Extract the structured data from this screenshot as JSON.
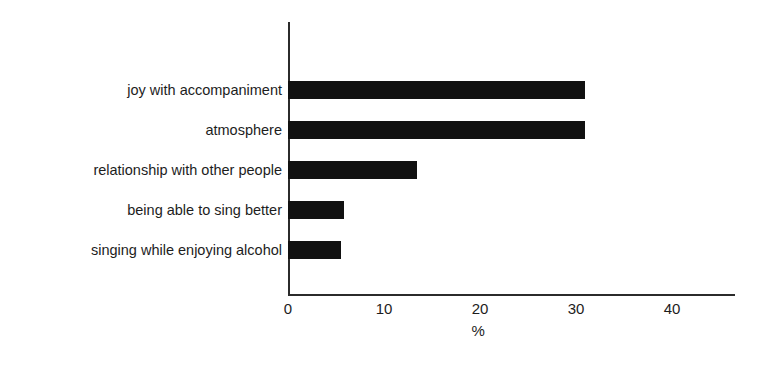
{
  "chart_data": {
    "type": "bar",
    "orientation": "horizontal",
    "title": "",
    "subtitle": "",
    "xlabel": "%",
    "ylabel": "",
    "categories": [
      "joy with accompaniment",
      "atmosphere",
      "relationship with other people",
      "being able to sing better",
      "singing while enjoying alcohol"
    ],
    "values": [
      30.9,
      30.9,
      13.4,
      5.8,
      5.5
    ],
    "xticks": [
      0,
      10,
      20,
      30,
      40
    ],
    "xtick_labels": [
      "0",
      "10",
      "20",
      "30",
      "40"
    ],
    "xlim": [
      0,
      46.5
    ],
    "grid": false,
    "legend": false,
    "legend_position": "none",
    "bar_color": "#111111",
    "axis_color": "#2b2b2b",
    "background_color": "#ffffff"
  }
}
